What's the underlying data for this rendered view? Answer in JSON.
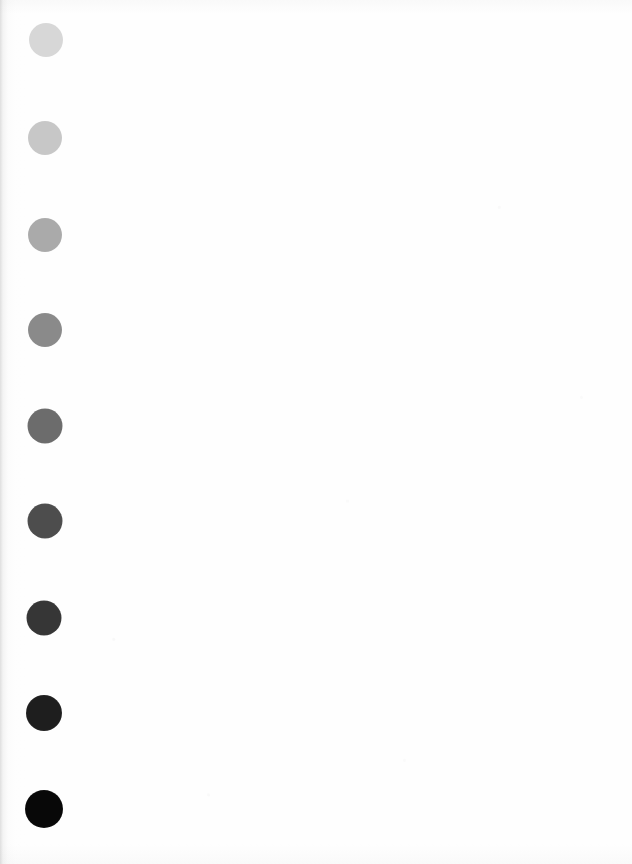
{
  "document": {
    "kind": "scanned-page",
    "page_background": "#fefefe",
    "width": 632,
    "height": 864,
    "body_text": "",
    "caption": ""
  },
  "chart_data": {
    "type": "scatter",
    "subtitle": "",
    "xlabel": "",
    "ylabel": "",
    "orientation": "vertical",
    "grid": false,
    "legend_position": "none",
    "categories": [
      "step-1",
      "step-2",
      "step-3",
      "step-4",
      "step-5",
      "step-6",
      "step-7",
      "step-8",
      "step-9"
    ],
    "series": [
      {
        "name": "Dot gray level (0 = black, 255 = white)",
        "values": [
          215,
          199,
          170,
          138,
          108,
          77,
          54,
          30,
          8
        ]
      },
      {
        "name": "Dot optical density (approx.)",
        "values": [
          0.07,
          0.11,
          0.18,
          0.27,
          0.37,
          0.52,
          0.67,
          0.93,
          1.5
        ]
      },
      {
        "name": "Dot diameter (px)",
        "values": [
          34,
          34,
          34,
          34,
          35,
          35,
          35,
          36,
          38
        ]
      }
    ],
    "points": [
      {
        "index": 1,
        "label": "step-1",
        "cx": 46,
        "cy": 40,
        "d": 34,
        "color": "#d7d7d7",
        "gray": 215
      },
      {
        "index": 2,
        "label": "step-2",
        "cx": 45,
        "cy": 138,
        "d": 34,
        "color": "#c7c7c7",
        "gray": 199
      },
      {
        "index": 3,
        "label": "step-3",
        "cx": 45,
        "cy": 235,
        "d": 34,
        "color": "#aaaaaa",
        "gray": 170
      },
      {
        "index": 4,
        "label": "step-4",
        "cx": 45,
        "cy": 330,
        "d": 34,
        "color": "#8a8a8a",
        "gray": 138
      },
      {
        "index": 5,
        "label": "step-5",
        "cx": 45,
        "cy": 426,
        "d": 35,
        "color": "#6c6c6c",
        "gray": 108
      },
      {
        "index": 6,
        "label": "step-6",
        "cx": 45,
        "cy": 521,
        "d": 35,
        "color": "#4d4d4d",
        "gray": 77
      },
      {
        "index": 7,
        "label": "step-7",
        "cx": 44,
        "cy": 618,
        "d": 35,
        "color": "#363636",
        "gray": 54
      },
      {
        "index": 8,
        "label": "step-8",
        "cx": 44,
        "cy": 713,
        "d": 36,
        "color": "#1e1e1e",
        "gray": 30
      },
      {
        "index": 9,
        "label": "step-9",
        "cx": 44,
        "cy": 809,
        "d": 38,
        "color": "#080808",
        "gray": 8
      }
    ],
    "xlim": [
      0,
      632
    ],
    "ylim": [
      0,
      864
    ]
  }
}
